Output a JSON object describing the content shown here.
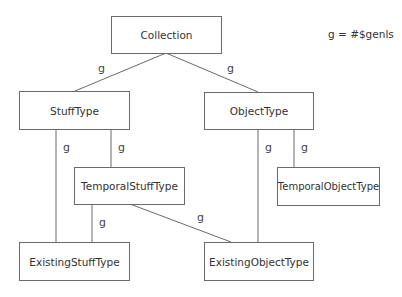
{
  "legend": {
    "text": "g = #$genls"
  },
  "nodes": {
    "collection": {
      "label": "Collection"
    },
    "stuff_type": {
      "label": "StuffType"
    },
    "object_type": {
      "label": "ObjectType"
    },
    "temporal_stuff_type": {
      "label": "TemporalStuffType"
    },
    "temporal_object_type": {
      "label": "TemporalObjectType"
    },
    "existing_stuff_type": {
      "label": "ExistingStuffType"
    },
    "existing_object_type": {
      "label": "ExistingObjectType"
    }
  },
  "edges": [
    {
      "from": "StuffType",
      "to": "Collection",
      "label": "g"
    },
    {
      "from": "ObjectType",
      "to": "Collection",
      "label": "g"
    },
    {
      "from": "ExistingStuffType",
      "to": "StuffType",
      "label": "g"
    },
    {
      "from": "TemporalStuffType",
      "to": "StuffType",
      "label": "g"
    },
    {
      "from": "ExistingObjectType",
      "to": "ObjectType",
      "label": "g"
    },
    {
      "from": "TemporalObjectType",
      "to": "ObjectType",
      "label": "g"
    },
    {
      "from": "ExistingStuffType",
      "to": "TemporalStuffType",
      "label": "g"
    },
    {
      "from": "ExistingObjectType",
      "to": "TemporalStuffType",
      "label": "g"
    }
  ]
}
